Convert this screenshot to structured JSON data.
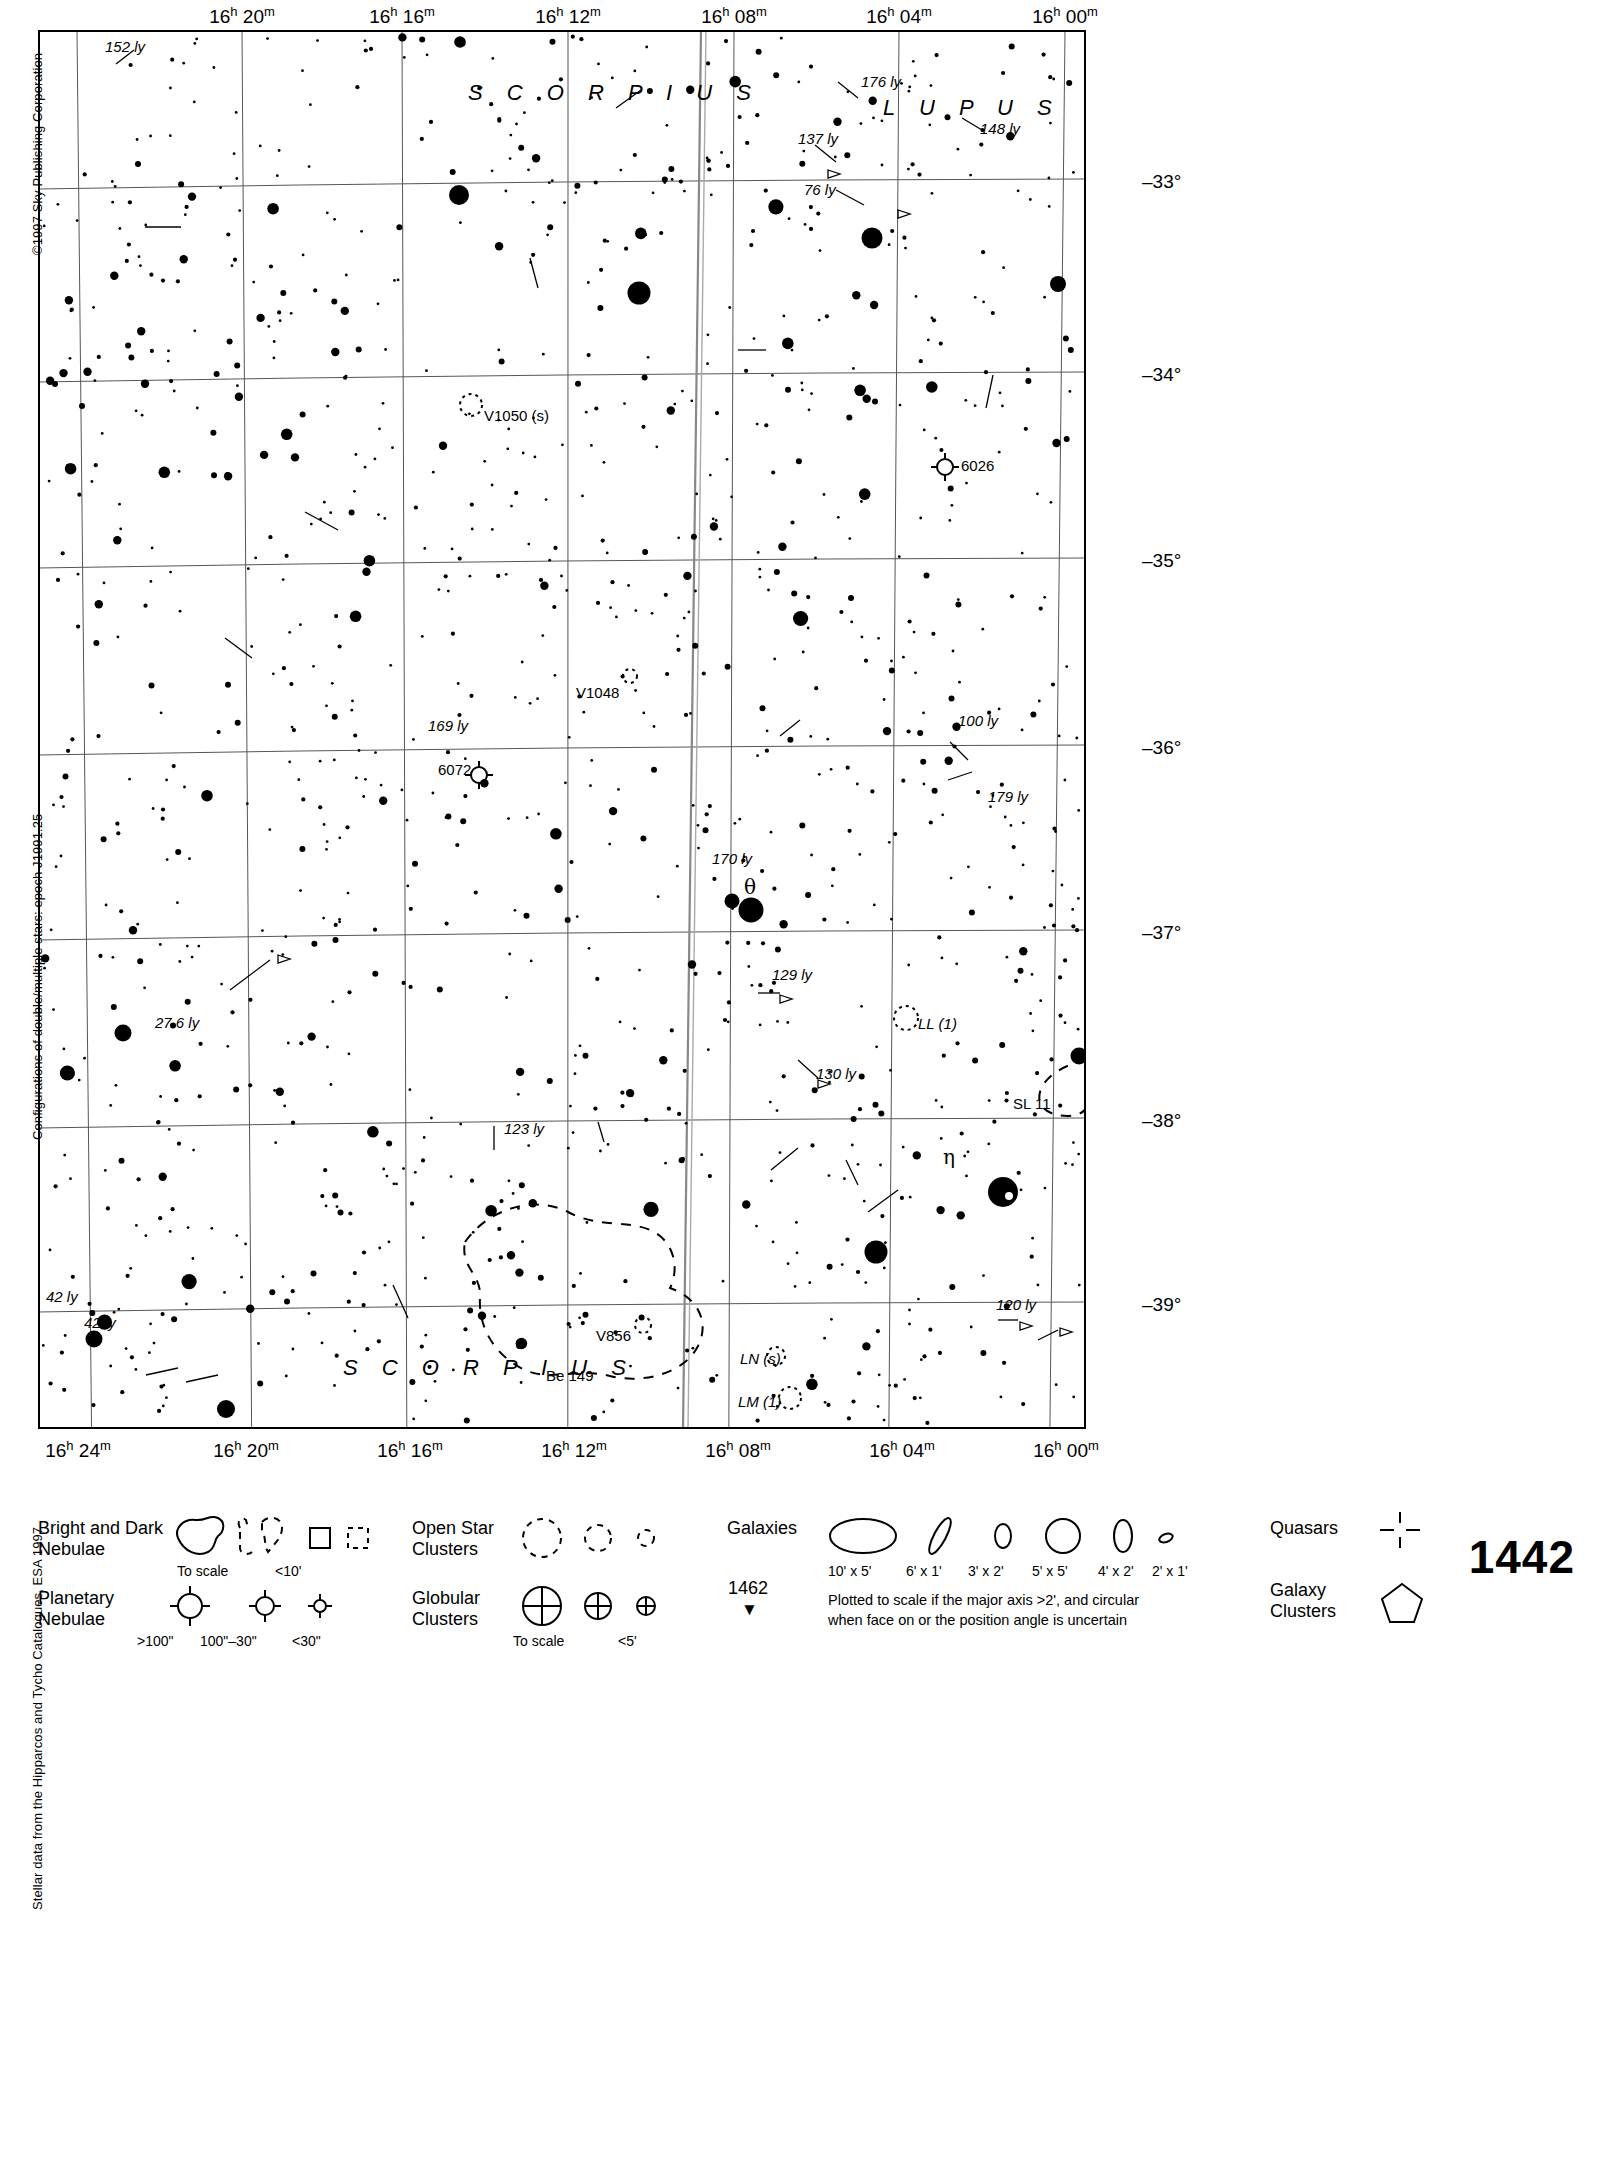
{
  "chart_data": {
    "type": "scatter",
    "chart_number": "1442",
    "next_chart_number": "1462",
    "epoch": "J1991.25",
    "xlabel": "Right Ascension",
    "ylabel": "Declination",
    "xlim": [
      "16h 25m",
      "15h 59m"
    ],
    "ylim": [
      -39.4,
      -32.45
    ],
    "grid": true,
    "ra_ticks_top": [
      "16h 20m",
      "16h 16m",
      "16h 12m",
      "16h 08m",
      "16h 04m",
      "16h 00m"
    ],
    "ra_ticks_bottom": [
      "16h 24m",
      "16h 20m",
      "16h 16m",
      "16h 12m",
      "16h 08m",
      "16h 04m",
      "16h 00m"
    ],
    "dec_ticks": [
      "-33°",
      "-34°",
      "-35°",
      "-36°",
      "-37°",
      "-38°",
      "-39°"
    ],
    "constellations": [
      "S C O R P I U S",
      "L U P U S",
      "S C O R P I U S"
    ],
    "deep_sky_objects": [
      {
        "name": "V1050 (s)",
        "type": "variable-star"
      },
      {
        "name": "V1048",
        "type": "variable-star"
      },
      {
        "name": "6026",
        "type": "planetary-nebula"
      },
      {
        "name": "6072",
        "type": "planetary-nebula"
      },
      {
        "name": "LL (1)",
        "type": "variable-star"
      },
      {
        "name": "LN (s)",
        "type": "variable-star"
      },
      {
        "name": "LM (1)",
        "type": "variable-star"
      },
      {
        "name": "V856",
        "type": "variable-star"
      },
      {
        "name": "Be 149",
        "type": "dark-nebula"
      },
      {
        "name": "SL 11",
        "type": "dark-nebula"
      },
      {
        "name": "θ",
        "type": "bright-star"
      },
      {
        "name": "η",
        "type": "bright-star"
      }
    ],
    "distance_labels": [
      "152 ly",
      "176 ly",
      "148 ly",
      "137 ly",
      "76 ly",
      "169 ly",
      "100 ly",
      "179 ly",
      "170 ly",
      "129 ly",
      "27.6 ly",
      "130 ly",
      "123 ly",
      "42 ly",
      "42 ly",
      "120 ly"
    ]
  },
  "credits": {
    "copyright": "©1997 Sky Publishing Corporation",
    "configurations": "Configurations of double/multiple stars: epoch J1991.25",
    "stellar_data": "Stellar data from the Hipparcos and Tycho Catalogues, ESA 1997"
  },
  "axes": {
    "ra_top": [
      {
        "label_html": "16<sup>h</sup> 20<sup>m</sup>",
        "x": 204
      },
      {
        "label_html": "16<sup>h</sup> 16<sup>m</sup>",
        "x": 364
      },
      {
        "label_html": "16<sup>h</sup> 12<sup>m</sup>",
        "x": 530
      },
      {
        "label_html": "16<sup>h</sup> 08<sup>m</sup>",
        "x": 696
      },
      {
        "label_html": "16<sup>h</sup> 04<sup>m</sup>",
        "x": 861
      },
      {
        "label_html": "16<sup>h</sup> 00<sup>m</sup>",
        "x": 1027
      }
    ],
    "ra_bottom": [
      {
        "label_html": "16<sup>h</sup> 24<sup>m</sup>",
        "x": 40
      },
      {
        "label_html": "16<sup>h</sup> 20<sup>m</sup>",
        "x": 208
      },
      {
        "label_html": "16<sup>h</sup> 16<sup>m</sup>",
        "x": 372
      },
      {
        "label_html": "16<sup>h</sup> 12<sup>m</sup>",
        "x": 536
      },
      {
        "label_html": "16<sup>h</sup> 08<sup>m</sup>",
        "x": 700
      },
      {
        "label_html": "16<sup>h</sup> 04<sup>m</sup>",
        "x": 864
      },
      {
        "label_html": "16<sup>h</sup> 00<sup>m</sup>",
        "x": 1028
      }
    ],
    "dec_right": [
      {
        "label": "–33°",
        "y": 152
      },
      {
        "label": "–34°",
        "y": 345
      },
      {
        "label": "–35°",
        "y": 531
      },
      {
        "label": "–36°",
        "y": 718
      },
      {
        "label": "–37°",
        "y": 903
      },
      {
        "label": "–38°",
        "y": 1091
      },
      {
        "label": "–39°",
        "y": 1275
      }
    ]
  },
  "labels": {
    "constellations": [
      {
        "text": "S C O R P I U S",
        "x": 430,
        "y": 50
      },
      {
        "text": "L U P U S",
        "x": 845,
        "y": 65
      },
      {
        "text": "S C O R P I U S",
        "x": 305,
        "y": 1325
      }
    ],
    "objects": [
      {
        "text": "152 ly",
        "x": 67,
        "y": 8,
        "ital": true
      },
      {
        "text": "176 ly",
        "x": 823,
        "y": 43,
        "ital": true
      },
      {
        "text": "148 ly",
        "x": 942,
        "y": 90,
        "ital": true
      },
      {
        "text": "137 ly",
        "x": 760,
        "y": 100,
        "ital": true
      },
      {
        "text": "76 ly",
        "x": 766,
        "y": 151,
        "ital": true
      },
      {
        "text": "V1050 (s)",
        "x": 446,
        "y": 377,
        "ital": false
      },
      {
        "text": "6026",
        "x": 923,
        "y": 427,
        "ital": false
      },
      {
        "text": "V1048",
        "x": 538,
        "y": 654,
        "ital": false
      },
      {
        "text": "169 ly",
        "x": 390,
        "y": 687,
        "ital": true
      },
      {
        "text": "100 ly",
        "x": 920,
        "y": 682,
        "ital": true
      },
      {
        "text": "6072",
        "x": 400,
        "y": 731,
        "ital": false
      },
      {
        "text": "179 ly",
        "x": 950,
        "y": 758,
        "ital": true
      },
      {
        "text": "170 ly",
        "x": 674,
        "y": 820,
        "ital": true
      },
      {
        "text": "θ",
        "x": 706,
        "y": 845,
        "ital": false,
        "greek": true
      },
      {
        "text": "129 ly",
        "x": 734,
        "y": 936,
        "ital": true
      },
      {
        "text": "27.6 ly",
        "x": 117,
        "y": 984,
        "ital": true
      },
      {
        "text": "LL (1)",
        "x": 880,
        "y": 985,
        "ital": true
      },
      {
        "text": "130 ly",
        "x": 778,
        "y": 1035,
        "ital": true
      },
      {
        "text": "SL 11",
        "x": 975,
        "y": 1065,
        "ital": false
      },
      {
        "text": "123 ly",
        "x": 466,
        "y": 1090,
        "ital": true
      },
      {
        "text": "η",
        "x": 905,
        "y": 1115,
        "ital": false,
        "greek": true
      },
      {
        "text": "42 ly",
        "x": 8,
        "y": 1258,
        "ital": true
      },
      {
        "text": "42 ly",
        "x": 46,
        "y": 1284,
        "ital": true
      },
      {
        "text": "120 ly",
        "x": 958,
        "y": 1266,
        "ital": true
      },
      {
        "text": "V856",
        "x": 558,
        "y": 1297,
        "ital": false
      },
      {
        "text": "LN (s)",
        "x": 702,
        "y": 1320,
        "ital": true
      },
      {
        "text": "Be 149",
        "x": 508,
        "y": 1337,
        "ital": false
      },
      {
        "text": "LM (1)",
        "x": 700,
        "y": 1363,
        "ital": true
      }
    ]
  },
  "legend": {
    "bright_dark_nebulae": {
      "title": "Bright and Dark\nNebulae",
      "sub_to_scale": "To scale",
      "sub_lt10": "<10'"
    },
    "planetary_nebulae": {
      "title": "Planetary\nNebulae",
      "sub_gt100": ">100\"",
      "sub_100_30": "100\"–30\"",
      "sub_lt30": "<30\""
    },
    "open_star_clusters": {
      "title": "Open Star\nClusters"
    },
    "globular_clusters": {
      "title": "Globular\nClusters",
      "sub_to_scale": "To scale",
      "sub_lt5": "<5'"
    },
    "galaxies": {
      "title": "Galaxies",
      "sizes": [
        "10' x 5'",
        "6' x 1'",
        "3' x 2'",
        "5' x 5'",
        "4' x 2'",
        "2' x 1'"
      ],
      "note": "Plotted to scale if the major axis >2', and circular\nwhen face on or the position angle is uncertain"
    },
    "quasars": {
      "title": "Quasars"
    },
    "galaxy_clusters": {
      "title": "Galaxy\nClusters"
    },
    "chart_number": "1442",
    "next_chart": {
      "number": "1462",
      "arrow": "▼"
    }
  }
}
